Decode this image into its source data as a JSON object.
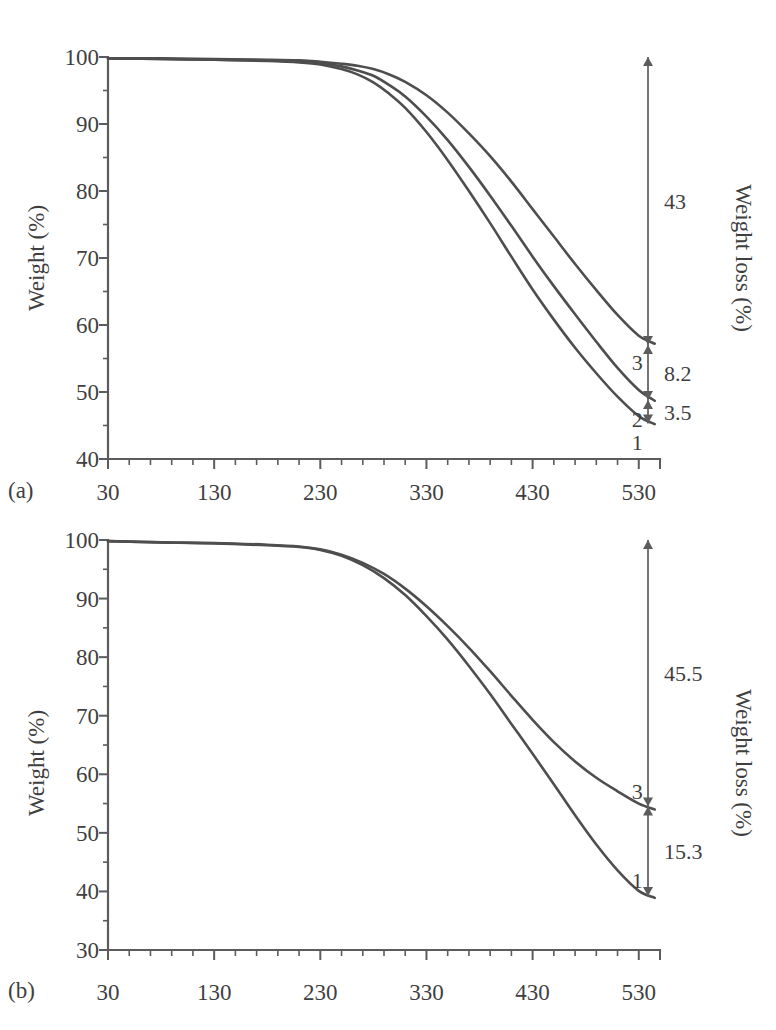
{
  "figure": {
    "panels": [
      {
        "id": "a",
        "letter": "(a)",
        "y_axis_title": "Weight (%)",
        "right_axis_title": "Weight loss (%)",
        "x_ticks": [
          "30",
          "130",
          "230",
          "330",
          "430",
          "530"
        ],
        "y_ticks": [
          "40",
          "50",
          "60",
          "70",
          "80",
          "90",
          "100"
        ],
        "curve_labels": [
          "1",
          "2",
          "3"
        ],
        "annotations": [
          "43",
          "8.2",
          "3.5"
        ]
      },
      {
        "id": "b",
        "letter": "(b)",
        "y_axis_title": "Weight (%)",
        "right_axis_title": "Weight loss (%)",
        "x_ticks": [
          "30",
          "130",
          "230",
          "330",
          "430",
          "530"
        ],
        "y_ticks": [
          "30",
          "40",
          "50",
          "60",
          "70",
          "80",
          "90",
          "100"
        ],
        "curve_labels": [
          "1",
          "3"
        ],
        "annotations": [
          "45.5",
          "15.3"
        ]
      }
    ],
    "colors": {
      "curve": "#4e4e4e",
      "axis": "#5c5c5c",
      "text": "#3f3f3f",
      "background": "#ffffff"
    }
  },
  "chart_data": [
    {
      "type": "line",
      "panel": "a",
      "title": "",
      "xlabel": "",
      "ylabel": "Weight (%)",
      "y2label": "Weight loss (%)",
      "xlim": [
        30,
        550
      ],
      "ylim": [
        40,
        100
      ],
      "xticks": [
        30,
        130,
        230,
        330,
        430,
        530
      ],
      "yticks": [
        40,
        50,
        60,
        70,
        80,
        90,
        100
      ],
      "xtick_minor_step": 20,
      "ytick_minor_step": 5,
      "grid": false,
      "legend": "inline-curve-labels",
      "series": [
        {
          "name": "1",
          "label_position": "end-below",
          "x": [
            30,
            80,
            130,
            180,
            210,
            230,
            250,
            265,
            280,
            295,
            310,
            330,
            350,
            370,
            390,
            410,
            430,
            450,
            470,
            490,
            510,
            530,
            545
          ],
          "values": [
            99.8,
            99.7,
            99.6,
            99.4,
            99.2,
            98.9,
            98.2,
            97.4,
            96.2,
            94.5,
            92.4,
            88.8,
            84.6,
            80.0,
            75.2,
            70.2,
            65.3,
            60.8,
            56.6,
            52.8,
            49.3,
            46.4,
            45.2
          ]
        },
        {
          "name": "2",
          "label_position": "end-below",
          "x": [
            30,
            80,
            130,
            180,
            210,
            230,
            250,
            265,
            280,
            295,
            310,
            330,
            350,
            370,
            390,
            410,
            430,
            450,
            470,
            490,
            510,
            530,
            545
          ],
          "values": [
            99.8,
            99.7,
            99.6,
            99.5,
            99.3,
            99.1,
            98.6,
            98.0,
            97.2,
            95.8,
            94.1,
            91.1,
            87.6,
            83.6,
            79.3,
            74.8,
            70.2,
            65.8,
            61.6,
            57.5,
            53.6,
            50.3,
            48.7
          ]
        },
        {
          "name": "3",
          "label_position": "end-below",
          "x": [
            30,
            80,
            130,
            180,
            210,
            230,
            250,
            265,
            280,
            295,
            310,
            330,
            350,
            370,
            390,
            410,
            430,
            450,
            470,
            490,
            510,
            530,
            545
          ],
          "values": [
            99.8,
            99.8,
            99.7,
            99.6,
            99.5,
            99.3,
            99.0,
            98.7,
            98.2,
            97.4,
            96.3,
            94.3,
            91.7,
            88.6,
            85.2,
            81.4,
            77.3,
            73.2,
            69.1,
            65.2,
            61.5,
            58.4,
            57.2
          ]
        }
      ],
      "annotations": [
        {
          "text": "43",
          "type": "double-arrow",
          "from_value": 100,
          "to_value": 57.0
        },
        {
          "text": "8.2",
          "type": "double-arrow",
          "from_value": 57.0,
          "to_value": 48.8
        },
        {
          "text": "3.5",
          "type": "double-arrow",
          "from_value": 48.8,
          "to_value": 45.3
        }
      ]
    },
    {
      "type": "line",
      "panel": "b",
      "title": "",
      "xlabel": "",
      "ylabel": "Weight (%)",
      "y2label": "Weight loss (%)",
      "xlim": [
        30,
        550
      ],
      "ylim": [
        30,
        100
      ],
      "xticks": [
        30,
        130,
        230,
        330,
        430,
        530
      ],
      "yticks": [
        30,
        40,
        50,
        60,
        70,
        80,
        90,
        100
      ],
      "xtick_minor_step": 20,
      "ytick_minor_step": 5,
      "grid": false,
      "legend": "inline-curve-labels",
      "series": [
        {
          "name": "1",
          "label_position": "end-above",
          "x": [
            30,
            80,
            130,
            180,
            210,
            230,
            250,
            270,
            290,
            310,
            330,
            350,
            370,
            390,
            410,
            430,
            450,
            470,
            490,
            510,
            530,
            545
          ],
          "values": [
            99.8,
            99.6,
            99.4,
            99.1,
            98.8,
            98.3,
            97.3,
            95.7,
            93.5,
            90.6,
            87.0,
            83.0,
            78.5,
            73.7,
            68.6,
            63.5,
            58.3,
            53.0,
            48.0,
            43.6,
            40.1,
            38.9
          ]
        },
        {
          "name": "3",
          "label_position": "end-above",
          "x": [
            30,
            80,
            130,
            180,
            210,
            230,
            250,
            270,
            290,
            310,
            330,
            350,
            370,
            390,
            410,
            430,
            450,
            470,
            490,
            510,
            530,
            545
          ],
          "values": [
            99.8,
            99.6,
            99.5,
            99.2,
            98.9,
            98.4,
            97.5,
            96.1,
            94.2,
            91.7,
            88.7,
            85.3,
            81.6,
            77.6,
            73.4,
            69.3,
            65.5,
            62.2,
            59.4,
            57.1,
            55.0,
            54.0
          ]
        }
      ],
      "annotations": [
        {
          "text": "45.5",
          "type": "double-arrow",
          "from_value": 100,
          "to_value": 54.5
        },
        {
          "text": "15.3",
          "type": "double-arrow",
          "from_value": 54.5,
          "to_value": 39.2
        }
      ]
    }
  ]
}
